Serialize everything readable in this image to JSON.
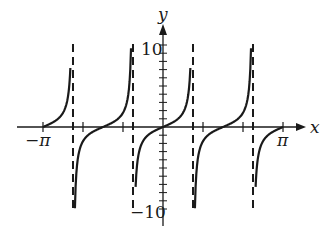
{
  "chart_data": {
    "type": "line",
    "function": "y = tan(2x)",
    "title": "",
    "xlabel": "x",
    "ylabel": "y",
    "xlim": [
      -3.14159,
      3.14159
    ],
    "ylim": [
      -10,
      10
    ],
    "grid": false,
    "x_tick_labels": [
      {
        "value": -3.14159,
        "label": "−π"
      },
      {
        "value": 3.14159,
        "label": "π"
      }
    ],
    "x_ticks": [
      -3.14159,
      -2.0944,
      -1.0472,
      1.0472,
      2.0944,
      3.14159
    ],
    "y_tick_labels": [
      {
        "value": 10,
        "label": "10"
      },
      {
        "value": -10,
        "label": "−10"
      }
    ],
    "y_ticks_step": 1,
    "asymptotes": [
      -2.35619,
      -0.785398,
      0.785398,
      2.35619
    ],
    "branches": [
      {
        "x_start": -3.14159,
        "y_end": 7.2,
        "note": "rises from 0 at x=-π toward asymptote x=-3π/4"
      },
      {
        "y_start": -9.9,
        "y_end": 9.6,
        "note": "between x=-3π/4 and x=-π/4, zero at x=-π/2"
      },
      {
        "y_start": -7.3,
        "y_end": 7.2,
        "note": "between x=-π/4 and x=π/4, zero at x=0"
      },
      {
        "y_start": -9.9,
        "y_end": 9.6,
        "note": "between x=π/4 and x=3π/4, zero at x=π/2"
      },
      {
        "y_start": -7.3,
        "x_end": 3.14159,
        "note": "rises from asymptote x=3π/4 to 0 at x=π"
      }
    ],
    "legend": null
  },
  "labels": {
    "x_axis": "x",
    "y_axis": "y",
    "neg_pi": "−π",
    "pi": "π",
    "y_top": "10",
    "y_bottom": "−10"
  }
}
